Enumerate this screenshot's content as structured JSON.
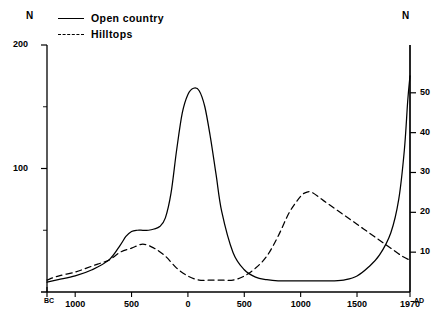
{
  "axis_names": {
    "left": "N",
    "right": "N"
  },
  "legend": {
    "items": [
      {
        "label": "Open country",
        "style": "solid"
      },
      {
        "label": "Hilltops",
        "style": "dashed"
      }
    ]
  },
  "era": {
    "start": "BC",
    "end": "AD"
  },
  "chart_data": {
    "type": "line",
    "title": "",
    "xlabel": "",
    "ylabel": "N",
    "grid": false,
    "legend_position": "top-left",
    "xlim": [
      -1250,
      1970
    ],
    "xticks": [
      -1000,
      -500,
      0,
      500,
      1000,
      1500,
      1970
    ],
    "xticklabels": [
      "1000",
      "500",
      "0",
      "500",
      "1000",
      "1500",
      "1970"
    ],
    "left_axis": {
      "label": "N",
      "ylim": [
        0,
        200
      ],
      "ticks": [
        50,
        100,
        150,
        200
      ],
      "ticklabels": [
        "",
        "100",
        "",
        "200"
      ],
      "labeled_ticks": [
        100,
        200
      ]
    },
    "right_axis": {
      "label": "N",
      "ylim": [
        0,
        62
      ],
      "ticks": [
        10,
        20,
        30,
        40,
        50
      ],
      "ticklabels": [
        "10",
        "20",
        "30",
        "40",
        "50"
      ]
    },
    "series": [
      {
        "name": "Open country",
        "style": "solid",
        "axis": "left",
        "x": [
          -1250,
          -1150,
          -1000,
          -850,
          -700,
          -600,
          -550,
          -500,
          -450,
          -400,
          -350,
          -300,
          -250,
          -200,
          -150,
          -100,
          -50,
          0,
          50,
          100,
          150,
          200,
          250,
          300,
          400,
          500,
          600,
          700,
          800,
          900,
          1000,
          1100,
          1200,
          1300,
          1400,
          1500,
          1600,
          1700,
          1800,
          1870,
          1920,
          1950,
          1970
        ],
        "values": [
          8,
          10,
          13,
          18,
          26,
          38,
          45,
          49,
          50,
          50,
          50,
          51,
          53,
          60,
          80,
          115,
          145,
          160,
          165,
          163,
          150,
          125,
          95,
          65,
          32,
          18,
          12,
          10,
          9,
          9,
          9,
          9,
          9,
          9,
          10,
          13,
          20,
          30,
          48,
          75,
          115,
          155,
          175
        ]
      },
      {
        "name": "Hilltops",
        "style": "dashed",
        "axis": "right",
        "x": [
          -1250,
          -1150,
          -1000,
          -900,
          -800,
          -700,
          -600,
          -500,
          -400,
          -300,
          -200,
          -100,
          0,
          100,
          200,
          300,
          400,
          500,
          600,
          700,
          800,
          900,
          1000,
          1050,
          1100,
          1200,
          1300,
          1400,
          1500,
          1600,
          1700,
          1800,
          1900,
          1970
        ],
        "values": [
          3,
          4,
          5,
          6,
          7,
          8,
          10,
          11,
          12,
          11,
          9,
          6,
          4,
          3,
          3,
          3,
          3,
          4,
          6,
          9,
          14,
          20,
          24,
          25,
          25,
          23,
          21,
          19,
          17,
          15,
          13,
          11,
          9,
          8
        ]
      }
    ]
  }
}
